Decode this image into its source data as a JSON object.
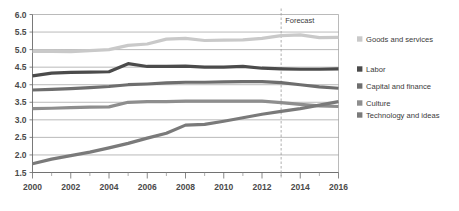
{
  "chart_data": {
    "type": "line",
    "title": "",
    "subtitle": "",
    "xlabel": "",
    "ylabel": "",
    "xlim": [
      2000,
      2016
    ],
    "ylim": [
      1.5,
      6.0
    ],
    "grid": true,
    "legend_position": "right",
    "y_ticks": [
      "6.0",
      "5.5",
      "5.0",
      "4.5",
      "4.0",
      "3.5",
      "3.0",
      "2.5",
      "2.0",
      "1.5"
    ],
    "y_tick_values": [
      6.0,
      5.5,
      5.0,
      4.5,
      4.0,
      3.5,
      3.0,
      2.5,
      2.0,
      1.5
    ],
    "x_ticks": [
      "2000",
      "2002",
      "2004",
      "2006",
      "2008",
      "2010",
      "2012",
      "2014",
      "2016"
    ],
    "x_tick_values": [
      2000,
      2002,
      2004,
      2006,
      2008,
      2010,
      2012,
      2014,
      2016
    ],
    "x": [
      2000,
      2001,
      2002,
      2003,
      2004,
      2005,
      2006,
      2007,
      2008,
      2009,
      2010,
      2011,
      2012,
      2013,
      2014,
      2015,
      2016
    ],
    "annotations": [
      {
        "name": "forecast-divider",
        "label": "Forecast",
        "x_value": 2013
      }
    ],
    "series": [
      {
        "name": "Goods and services",
        "color": "#c9c9c9",
        "width": 3.2,
        "values": [
          4.95,
          4.95,
          4.94,
          4.97,
          5.0,
          5.12,
          5.16,
          5.3,
          5.32,
          5.26,
          5.27,
          5.28,
          5.32,
          5.4,
          5.42,
          5.34,
          5.35
        ]
      },
      {
        "name": "Labor",
        "color": "#4b4b4b",
        "width": 3.2,
        "values": [
          4.25,
          4.33,
          4.35,
          4.36,
          4.37,
          4.6,
          4.52,
          4.52,
          4.53,
          4.5,
          4.5,
          4.52,
          4.47,
          4.45,
          4.44,
          4.44,
          4.45
        ]
      },
      {
        "name": "Capital and finance",
        "color": "#6e6e6e",
        "width": 3.2,
        "values": [
          3.85,
          3.87,
          3.89,
          3.92,
          3.95,
          4.0,
          4.02,
          4.05,
          4.07,
          4.07,
          4.08,
          4.09,
          4.09,
          4.06,
          4.0,
          3.94,
          3.9
        ]
      },
      {
        "name": "Culture",
        "color": "#8e8e8e",
        "width": 3.2,
        "values": [
          3.32,
          3.33,
          3.35,
          3.36,
          3.37,
          3.5,
          3.52,
          3.52,
          3.53,
          3.53,
          3.53,
          3.53,
          3.53,
          3.49,
          3.44,
          3.4,
          3.38
        ]
      },
      {
        "name": "Technology and ideas",
        "color": "#7a7a7a",
        "width": 3.2,
        "values": [
          1.75,
          1.88,
          1.98,
          2.08,
          2.2,
          2.33,
          2.48,
          2.62,
          2.85,
          2.87,
          2.96,
          3.06,
          3.16,
          3.24,
          3.32,
          3.42,
          3.52
        ]
      }
    ]
  },
  "legend": {
    "items": [
      {
        "label": "Goods and services",
        "color": "#c9c9c9"
      },
      {
        "label": "Labor",
        "color": "#4b4b4b"
      },
      {
        "label": "Capital and finance",
        "color": "#6e6e6e"
      },
      {
        "label": "Culture",
        "color": "#8e8e8e"
      },
      {
        "label": "Technology and ideas",
        "color": "#7a7a7a"
      }
    ]
  }
}
